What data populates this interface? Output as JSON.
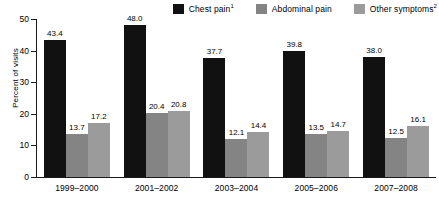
{
  "chart_data": {
    "type": "bar",
    "title": "",
    "subtitle": "",
    "xlabel": "",
    "ylabel": "Percent of visits",
    "ylim": [
      0,
      50
    ],
    "yticks": [
      0,
      10,
      20,
      30,
      40,
      50
    ],
    "ytick_labels": [
      "0",
      "10",
      "20",
      "30",
      "40",
      "50"
    ],
    "grid": false,
    "legend_position": "top-right",
    "categories": [
      "1999–2000",
      "2001–2002",
      "2003–2004",
      "2005–2006",
      "2007–2008"
    ],
    "series": [
      {
        "name": "Chest pain",
        "footnote_mark": "1",
        "color": "#111111",
        "values": [
          43.4,
          48.0,
          37.7,
          39.8,
          38.0
        ],
        "labels": [
          "43.4",
          "48.0",
          "37.7",
          "39.8",
          "38.0"
        ]
      },
      {
        "name": "Abdominal pain",
        "footnote_mark": "",
        "color": "#848484",
        "values": [
          13.7,
          20.4,
          12.1,
          13.5,
          12.5
        ],
        "labels": [
          "13.7",
          "20.4",
          "12.1",
          "13.5",
          "12.5"
        ]
      },
      {
        "name": "Other symptoms",
        "footnote_mark": "2",
        "color": "#9b9b9b",
        "values": [
          17.2,
          20.8,
          14.4,
          14.7,
          16.1
        ],
        "labels": [
          "17.2",
          "20.8",
          "14.4",
          "14.7",
          "16.1"
        ]
      }
    ]
  },
  "legend": {
    "items": [
      {
        "label": "Chest pain",
        "mark": "1",
        "color": "#111111"
      },
      {
        "label": "Abdominal pain",
        "mark": "",
        "color": "#848484"
      },
      {
        "label": "Other symptoms",
        "mark": "2",
        "color": "#9b9b9b"
      }
    ]
  },
  "axes": {
    "y_title": "Percent of visits",
    "y_tick_labels": [
      "50",
      "40",
      "30",
      "20",
      "10",
      "0"
    ],
    "x_tick_labels": [
      "1999–2000",
      "2001–2002",
      "2003–2004",
      "2005–2006",
      "2007–2008"
    ]
  }
}
